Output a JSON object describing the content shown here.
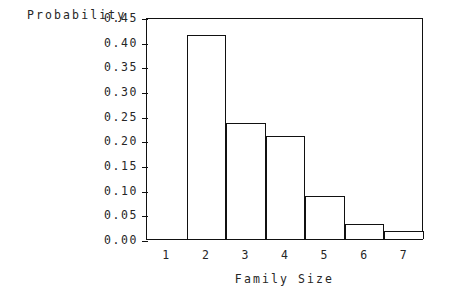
{
  "chart_data": {
    "type": "bar",
    "title": "",
    "subtitle": "",
    "xlabel": "Family Size",
    "ylabel": "Probability",
    "categories": [
      "1",
      "2",
      "3",
      "4",
      "5",
      "6",
      "7"
    ],
    "values": [
      0.0,
      0.413,
      0.235,
      0.208,
      0.088,
      0.031,
      0.016
    ],
    "series": [
      {
        "name": "Probability",
        "values": [
          0.0,
          0.413,
          0.235,
          0.208,
          0.088,
          0.031,
          0.016
        ]
      }
    ],
    "ylim": [
      0.0,
      0.45
    ],
    "xlim": [
      0.5,
      7.5
    ],
    "yticks": [
      0.0,
      0.05,
      0.1,
      0.15,
      0.2,
      0.25,
      0.3,
      0.35,
      0.4,
      0.45
    ],
    "ytick_labels": [
      "0.00",
      "0.05",
      "0.10",
      "0.15",
      "0.20",
      "0.25",
      "0.30",
      "0.35",
      "0.40",
      "0.45"
    ],
    "xtick_labels": [
      "1",
      "2",
      "3",
      "4",
      "5",
      "6",
      "7"
    ],
    "grid": false,
    "legend": false,
    "legend_position": "none",
    "bar_fill_color": "#ffffff",
    "bar_edge_color": "#111111",
    "axis_color": "#111111",
    "background_color": "#ffffff",
    "text_color": "#262626",
    "annotations": []
  }
}
